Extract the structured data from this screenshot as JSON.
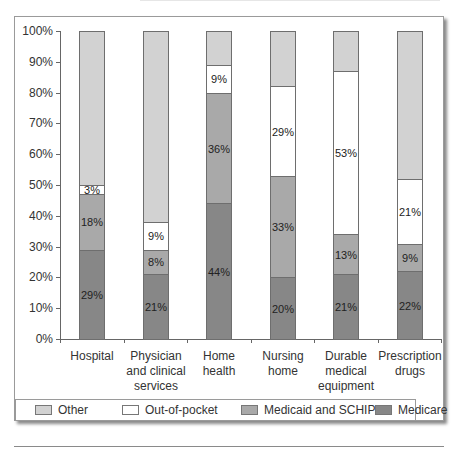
{
  "chart_data": {
    "type": "bar",
    "stacked": true,
    "title": "",
    "xlabel": "",
    "ylabel": "",
    "ylim": [
      0,
      100
    ],
    "yticks": [
      "0%",
      "10%",
      "20%",
      "30%",
      "40%",
      "50%",
      "60%",
      "70%",
      "80%",
      "90%",
      "100%"
    ],
    "grid": false,
    "legend_position": "bottom",
    "categories": [
      [
        "Hospital"
      ],
      [
        "Physician",
        "and clinical",
        "services"
      ],
      [
        "Home",
        "health"
      ],
      [
        "Nursing",
        "home"
      ],
      [
        "Durable",
        "medical",
        "equipment"
      ],
      [
        "Prescription",
        "drugs"
      ]
    ],
    "category_names": [
      "Hospital",
      "Physician and clinical services",
      "Home health",
      "Nursing home",
      "Durable medical equipment",
      "Prescription drugs"
    ],
    "series": [
      {
        "name": "Medicare",
        "color": "#878787",
        "values": [
          29,
          21,
          44,
          20,
          21,
          22
        ],
        "labels": [
          "29%",
          "21%",
          "44%",
          "20%",
          "21%",
          "22%"
        ]
      },
      {
        "name": "Medicaid and SCHIP",
        "color": "#a9a9a9",
        "values": [
          18,
          8,
          36,
          33,
          13,
          9
        ],
        "labels": [
          "18%",
          "8%",
          "36%",
          "33%",
          "13%",
          "9%"
        ]
      },
      {
        "name": "Out-of-pocket",
        "color": "#ffffff",
        "values": [
          3,
          9,
          9,
          29,
          53,
          21
        ],
        "labels": [
          "3%",
          "9%",
          "9%",
          "29%",
          "53%",
          "21%"
        ]
      },
      {
        "name": "Other",
        "color": "#d2d2d2",
        "values": [
          50,
          62,
          11,
          18,
          13,
          48
        ],
        "labels": [
          "",
          "",
          "",
          "",
          "",
          ""
        ]
      }
    ],
    "legend": [
      "Other",
      "Out-of-pocket",
      "Medicaid and SCHIP",
      "Medicare"
    ]
  }
}
